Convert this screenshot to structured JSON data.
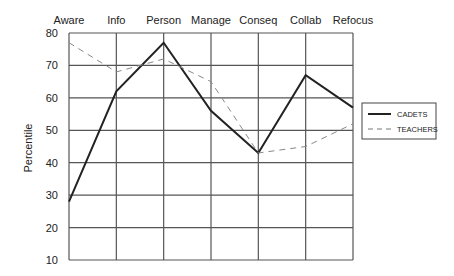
{
  "chart_data": {
    "type": "line",
    "title": "",
    "xlabel": "",
    "ylabel": "Percentile",
    "ylim": [
      10,
      80
    ],
    "yticks": [
      10,
      20,
      30,
      40,
      50,
      60,
      70,
      80
    ],
    "categories": [
      "Aware",
      "Info",
      "Person",
      "Manage",
      "Conseq",
      "Collab",
      "Refocus"
    ],
    "grid": true,
    "legend_position": "right",
    "series": [
      {
        "name": "CADETS",
        "style": "solid",
        "values": [
          28,
          62,
          77,
          56,
          43,
          67,
          57
        ]
      },
      {
        "name": "TEACHERS",
        "style": "dashed",
        "values": [
          77,
          68,
          72,
          65,
          43,
          45,
          52
        ]
      }
    ]
  },
  "labels": {
    "ylabel": "Percentile",
    "legend": [
      "CADETS",
      "TEACHERS"
    ],
    "categories": [
      "Aware",
      "Info",
      "Person",
      "Manage",
      "Conseq",
      "Collab",
      "Refocus"
    ],
    "yticks": [
      "80",
      "70",
      "60",
      "50",
      "40",
      "30",
      "20",
      "10"
    ]
  }
}
